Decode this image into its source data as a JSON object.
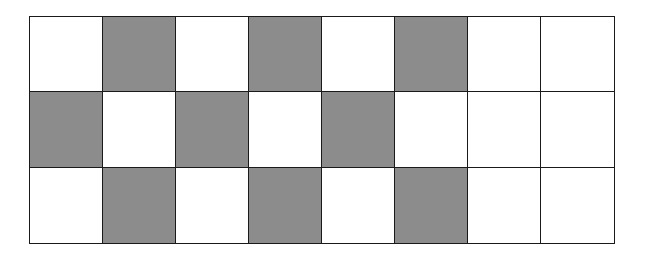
{
  "grid": {
    "rows": 3,
    "cols": 8,
    "colors": {
      "shaded": "#8c8c8c",
      "unshaded": "#ffffff",
      "border": "#1a1a1a"
    },
    "cells": [
      [
        0,
        1,
        0,
        1,
        0,
        1,
        0,
        0
      ],
      [
        1,
        0,
        1,
        0,
        1,
        0,
        0,
        0
      ],
      [
        0,
        1,
        0,
        1,
        0,
        1,
        0,
        0
      ]
    ],
    "shaded_count": 9,
    "total_count": 24
  }
}
